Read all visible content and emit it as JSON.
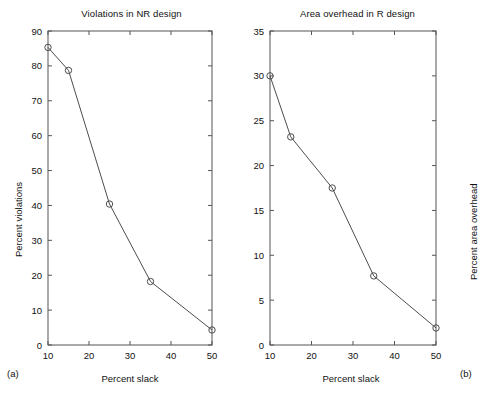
{
  "figure": {
    "background": "#ffffff",
    "line_color": "#4d4d4d",
    "axis_color": "#555555",
    "marker": "open-circle"
  },
  "panels": [
    {
      "caption": "(a)",
      "title": "Violations in NR design",
      "xlabel": "Percent slack",
      "ylabel": "Percent violations"
    },
    {
      "caption": "(b)",
      "title": "Area overhead in R design",
      "xlabel": "Percent slack",
      "ylabel": "Percent area overhead"
    }
  ],
  "chart_data": [
    {
      "type": "line",
      "title": "Violations in NR design",
      "xlabel": "Percent slack",
      "ylabel": "Percent violations",
      "x": [
        10,
        15,
        25,
        35,
        50
      ],
      "values": [
        85.3,
        78.7,
        40.4,
        18.2,
        4.3
      ],
      "xlim": [
        10,
        50
      ],
      "ylim": [
        0,
        90
      ],
      "xticks": [
        10,
        20,
        30,
        40,
        50
      ],
      "yticks": [
        0,
        10,
        20,
        30,
        40,
        50,
        60,
        70,
        80,
        90
      ],
      "xticklabels": [
        "10",
        "20",
        "30",
        "40",
        "50"
      ],
      "yticklabels": [
        "0",
        "10",
        "20",
        "30",
        "40",
        "50",
        "60",
        "70",
        "80",
        "90"
      ],
      "grid": false,
      "legend": null,
      "marker": "o",
      "caption": "(a)"
    },
    {
      "type": "line",
      "title": "Area overhead in R design",
      "xlabel": "Percent slack",
      "ylabel": "Percent area overhead",
      "x": [
        10,
        15,
        25,
        35,
        50
      ],
      "values": [
        30.0,
        23.2,
        17.5,
        7.7,
        1.9
      ],
      "xlim": [
        10,
        50
      ],
      "ylim": [
        0,
        35
      ],
      "xticks": [
        10,
        20,
        30,
        40,
        50
      ],
      "yticks": [
        0,
        5,
        10,
        15,
        20,
        25,
        30,
        35
      ],
      "xticklabels": [
        "10",
        "20",
        "30",
        "40",
        "50"
      ],
      "yticklabels": [
        "0",
        "5",
        "10",
        "15",
        "20",
        "25",
        "30",
        "35"
      ],
      "grid": false,
      "legend": null,
      "marker": "o",
      "caption": "(b)"
    }
  ]
}
